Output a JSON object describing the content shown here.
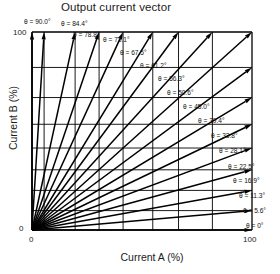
{
  "chart_title": "Output current vector",
  "axes": {
    "x_title": "Current A (%)",
    "y_title": "Current B (%)",
    "x_min_label": "0",
    "x_max_label": "100",
    "y_min_label": "0",
    "y_max_label": "100"
  },
  "chart_data": {
    "type": "scatter",
    "title": "Output current vector",
    "xlabel": "Current A (%)",
    "ylabel": "Current B (%)",
    "xlim": [
      0,
      100
    ],
    "ylim": [
      0,
      100
    ],
    "grid": true,
    "legend": "none",
    "angle_unit": "degrees",
    "series": [
      {
        "name": "Output current vectors",
        "points": [
          {
            "label": "θ = 90.0°",
            "theta": 90.0,
            "x": 0.0,
            "y": 100.0
          },
          {
            "label": "θ = 84.4°",
            "theta": 84.4,
            "x": 5.5,
            "y": 100.0
          },
          {
            "label": "θ = 78.8°",
            "theta": 78.8,
            "x": 19.6,
            "y": 100.0
          },
          {
            "label": "θ = 73.1°",
            "theta": 73.1,
            "x": 30.5,
            "y": 100.0
          },
          {
            "label": "θ = 67.5°",
            "theta": 67.5,
            "x": 41.4,
            "y": 100.0
          },
          {
            "label": "θ = 61.2°",
            "theta": 61.2,
            "x": 54.9,
            "y": 100.0
          },
          {
            "label": "θ = 56.3°",
            "theta": 56.3,
            "x": 66.6,
            "y": 100.0
          },
          {
            "label": "θ = 50.6°",
            "theta": 50.6,
            "x": 82.0,
            "y": 100.0
          },
          {
            "label": "θ = 45.0°",
            "theta": 45.0,
            "x": 100.0,
            "y": 100.0
          },
          {
            "label": "θ = 39.4°",
            "theta": 39.4,
            "x": 100.0,
            "y": 82.1
          },
          {
            "label": "θ = 33.8°",
            "theta": 33.8,
            "x": 100.0,
            "y": 66.9
          },
          {
            "label": "θ = 28.1°",
            "theta": 28.1,
            "x": 100.0,
            "y": 53.4
          },
          {
            "label": "θ = 22.5°",
            "theta": 22.5,
            "x": 100.0,
            "y": 41.4
          },
          {
            "label": "θ = 16.9°",
            "theta": 16.9,
            "x": 100.0,
            "y": 30.4
          },
          {
            "label": "θ = 11.3°",
            "theta": 11.3,
            "x": 100.0,
            "y": 20.0
          },
          {
            "label": "θ = 5.6°",
            "theta": 5.6,
            "x": 100.0,
            "y": 9.8
          },
          {
            "label": "θ = 0°",
            "theta": 0.0,
            "x": 100.0,
            "y": 0.0
          }
        ]
      }
    ]
  },
  "angle_labels": [
    {
      "text": "θ = 90.0°",
      "left": 24,
      "top": 19
    },
    {
      "text": "θ = 84.4°",
      "left": 61,
      "top": 21
    },
    {
      "text": "θ = 78.8°",
      "left": 73,
      "top": 32
    },
    {
      "text": "θ = 73.1°",
      "left": 103,
      "top": 37
    },
    {
      "text": "θ = 67.5°",
      "left": 120,
      "top": 50
    },
    {
      "text": "θ = 61.2°",
      "left": 140,
      "top": 63
    },
    {
      "text": "θ = 56.3°",
      "left": 158,
      "top": 76
    },
    {
      "text": "θ = 50.6°",
      "left": 167,
      "top": 90
    },
    {
      "text": "θ = 45.0°",
      "left": 183,
      "top": 104
    },
    {
      "text": "θ = 39.4°",
      "left": 198,
      "top": 118
    },
    {
      "text": "θ = 33.8°",
      "left": 211,
      "top": 133
    },
    {
      "text": "θ = 28.1°",
      "left": 219,
      "top": 148
    },
    {
      "text": "θ = 22.5°",
      "left": 228,
      "top": 164
    },
    {
      "text": "θ = 16.9°",
      "left": 233,
      "top": 178
    },
    {
      "text": "θ = 11.3°",
      "left": 239,
      "top": 193
    },
    {
      "text": "θ = 5.6°",
      "left": 243,
      "top": 208
    },
    {
      "text": "θ = 0°",
      "left": 246,
      "top": 223
    }
  ]
}
